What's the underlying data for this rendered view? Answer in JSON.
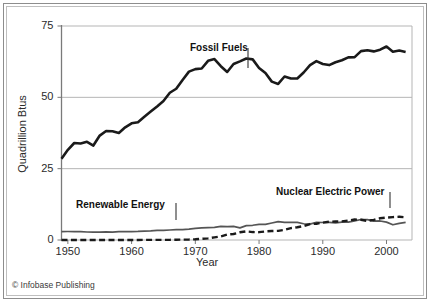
{
  "credit": "© Infobase Publishing",
  "axes": {
    "ylabel": "Quadrillion Btus",
    "xlabel": "Year",
    "yticks": [
      "0",
      "25",
      "50",
      "75"
    ],
    "xticks": [
      "1950",
      "1960",
      "1970",
      "1980",
      "1990",
      "2000"
    ]
  },
  "labels": {
    "fossil": "Fossil Fuels",
    "renewable": "Renewable Energy",
    "nuclear": "Nuclear Electric Power"
  },
  "colors": {
    "fossil_line": "#1a1a1a",
    "renewable_line": "#555555",
    "nuclear_line": "#1a1a1a",
    "gridline": "#b5b5b5",
    "axis": "#7a7a7a",
    "frame_outer": "#8d8d8d",
    "frame_inner": "#bfbfbf",
    "text": "#2b2b2b"
  },
  "chart_data": {
    "type": "line",
    "title": "",
    "xlabel": "Year",
    "ylabel": "Quadrillion Btus",
    "xlim": [
      1949,
      2004
    ],
    "ylim": [
      0,
      75
    ],
    "yticks": [
      0,
      25,
      50,
      75
    ],
    "xticks": [
      1950,
      1960,
      1970,
      1980,
      1990,
      2000
    ],
    "grid": true,
    "legend": "inline-annotations",
    "x": [
      1949,
      1950,
      1951,
      1952,
      1953,
      1954,
      1955,
      1956,
      1957,
      1958,
      1959,
      1960,
      1961,
      1962,
      1963,
      1964,
      1965,
      1966,
      1967,
      1968,
      1969,
      1970,
      1971,
      1972,
      1973,
      1974,
      1975,
      1976,
      1977,
      1978,
      1979,
      1980,
      1981,
      1982,
      1983,
      1984,
      1985,
      1986,
      1987,
      1988,
      1989,
      1990,
      1991,
      1992,
      1993,
      1994,
      1995,
      1996,
      1997,
      1998,
      1999,
      2000,
      2001,
      2002,
      2003
    ],
    "series": [
      {
        "name": "Fossil Fuels",
        "style": "solid-thick",
        "values": [
          28.5,
          31.6,
          34.0,
          33.8,
          34.4,
          33.1,
          36.6,
          38.2,
          38.1,
          37.5,
          39.5,
          40.9,
          41.3,
          43.2,
          45.0,
          46.8,
          48.7,
          51.6,
          53.0,
          56.1,
          59.0,
          59.9,
          60.1,
          62.8,
          63.4,
          60.9,
          58.9,
          61.7,
          62.6,
          63.6,
          63.3,
          60.3,
          58.5,
          55.5,
          54.7,
          57.3,
          56.6,
          56.6,
          58.7,
          61.3,
          62.7,
          61.7,
          61.3,
          62.3,
          63.0,
          64.0,
          64.1,
          66.2,
          66.5,
          66.1,
          66.7,
          67.8,
          66.0,
          66.4,
          65.9
        ]
      },
      {
        "name": "Renewable Energy",
        "style": "solid-medium",
        "values": [
          2.97,
          2.98,
          2.96,
          2.95,
          2.8,
          2.75,
          2.78,
          2.86,
          2.78,
          2.93,
          2.91,
          2.93,
          3.0,
          3.14,
          3.23,
          3.38,
          3.4,
          3.5,
          3.64,
          3.67,
          3.82,
          4.08,
          4.25,
          4.32,
          4.43,
          4.77,
          4.72,
          4.75,
          4.25,
          5.04,
          5.16,
          5.49,
          5.46,
          5.97,
          6.42,
          6.15,
          6.2,
          6.15,
          5.69,
          5.56,
          6.22,
          6.13,
          6.16,
          5.99,
          6.26,
          6.25,
          6.7,
          7.18,
          7.16,
          6.63,
          6.67,
          6.26,
          5.33,
          5.84,
          6.15
        ]
      },
      {
        "name": "Nuclear Electric Power",
        "style": "dashed-thick",
        "values": [
          0.0,
          0.0,
          0.0,
          0.0,
          0.0,
          0.0,
          0.0,
          0.0,
          0.02,
          0.02,
          0.02,
          0.01,
          0.02,
          0.03,
          0.04,
          0.04,
          0.04,
          0.06,
          0.09,
          0.14,
          0.15,
          0.24,
          0.41,
          0.58,
          0.91,
          1.27,
          1.9,
          2.11,
          2.7,
          3.02,
          2.78,
          2.74,
          3.01,
          3.13,
          3.2,
          3.55,
          4.15,
          4.47,
          4.91,
          5.59,
          5.68,
          6.1,
          6.42,
          6.48,
          6.52,
          6.84,
          7.18,
          7.09,
          6.68,
          7.07,
          7.61,
          7.86,
          8.03,
          8.14,
          7.96
        ]
      }
    ]
  }
}
